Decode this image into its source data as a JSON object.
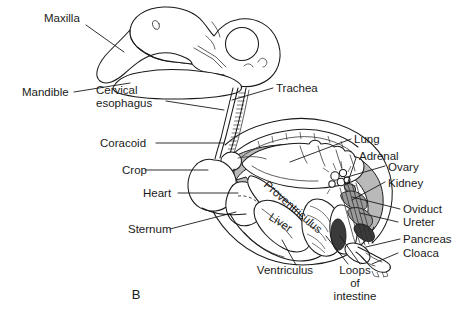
{
  "figure": {
    "caption": "B",
    "background_color": "#ffffff",
    "ink_color": "#1a1a1a",
    "shading_color": "#b9b9b9"
  },
  "labels": {
    "maxilla": "Maxilla",
    "mandible": "Mandible",
    "cervical_esophagus_line1": "Cervical",
    "cervical_esophagus_line2": "esophagus",
    "coracoid": "Coracoid",
    "crop": "Crop",
    "heart": "Heart",
    "sternum": "Sternum",
    "trachea": "Trachea",
    "lung": "Lung",
    "adrenal": "Adrenal",
    "ovary": "Ovary",
    "kidney": "Kidney",
    "oviduct": "Oviduct",
    "ureter": "Ureter",
    "pancreas": "Pancreas",
    "cloaca": "Cloaca",
    "proventriculus": "Proventriculus",
    "liver": "Liver",
    "ventriculus": "Ventriculus",
    "loops_line1": "Loops",
    "loops_line2": "of",
    "loops_line3": "intestine"
  }
}
